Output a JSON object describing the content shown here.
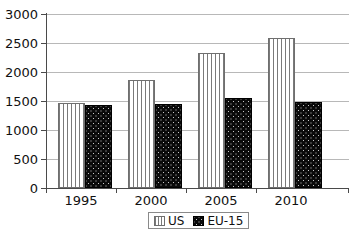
{
  "chart_data": {
    "type": "bar",
    "title": "",
    "subtitle": "",
    "xlabel": "",
    "ylabel": "",
    "categories": [
      "1995",
      "2000",
      "2005",
      "2010"
    ],
    "series": [
      {
        "name": "US",
        "values": [
          1460,
          1870,
          2320,
          2580
        ],
        "pattern": "vertical-stripes",
        "color": "#f2f2f2"
      },
      {
        "name": "EU-15",
        "values": [
          1430,
          1440,
          1560,
          1480
        ],
        "pattern": "dots-on-black",
        "color": "#0a0a0a"
      }
    ],
    "ylim": [
      0,
      3000
    ],
    "yticks": [
      0,
      500,
      1000,
      1500,
      2000,
      2500,
      3000
    ],
    "ytick_labels": [
      "0",
      "500",
      "1000",
      "1500",
      "2000",
      "2500",
      "3000"
    ],
    "grid": true,
    "grid_axis": "y",
    "legend_position": "bottom",
    "legend_entries": [
      "US",
      "EU-15"
    ]
  },
  "axes": {
    "y": {
      "labels": [
        "3000",
        "2500",
        "2000",
        "1500",
        "1000",
        "500",
        "0"
      ]
    },
    "x": {
      "labels": [
        "1995",
        "2000",
        "2005",
        "2010"
      ]
    }
  },
  "legend": {
    "items": [
      {
        "label": "US",
        "swatch": "vertical-stripe-swatch"
      },
      {
        "label": "EU-15",
        "swatch": "black-dotted-swatch"
      }
    ]
  }
}
